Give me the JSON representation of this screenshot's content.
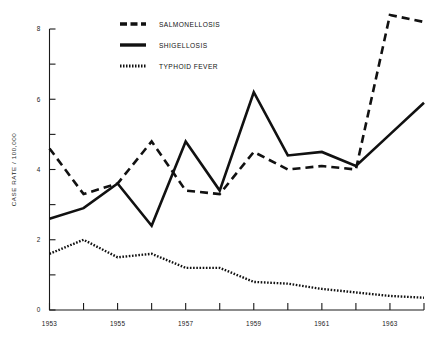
{
  "chart_data": {
    "type": "line",
    "title": "",
    "xlabel": "",
    "ylabel": "CASE RATE / 100,000",
    "x": [
      1953,
      1954,
      1955,
      1956,
      1957,
      1958,
      1959,
      1960,
      1961,
      1962,
      1963,
      1964
    ],
    "xlim": [
      1953,
      1964
    ],
    "ylim": [
      0,
      8
    ],
    "xticks": [
      1953,
      1954,
      1955,
      1956,
      1957,
      1958,
      1959,
      1960,
      1961,
      1962,
      1963,
      1964
    ],
    "xticklabels": [
      "1953",
      "",
      "1955",
      "",
      "1957",
      "",
      "1959",
      "",
      "1961",
      "",
      "1963",
      ""
    ],
    "yticks": [
      0,
      1,
      2,
      3,
      4,
      5,
      6,
      7,
      8
    ],
    "yticklabels": [
      "0",
      "",
      "2",
      "",
      "4",
      "",
      "6",
      "",
      "8"
    ],
    "grid": false,
    "legend_position": "top-center",
    "series": [
      {
        "name": "SALMONELLOSIS",
        "style": "dashed",
        "color": "#111111",
        "values": [
          4.6,
          3.3,
          3.6,
          4.8,
          3.4,
          3.3,
          4.5,
          4.0,
          4.1,
          4.0,
          8.4,
          8.2
        ]
      },
      {
        "name": "SHIGELLOSIS",
        "style": "solid",
        "color": "#111111",
        "values": [
          2.6,
          2.9,
          3.6,
          2.4,
          4.8,
          3.4,
          6.2,
          4.4,
          4.5,
          4.1,
          5.0,
          5.9
        ]
      },
      {
        "name": "TYPHOID FEVER",
        "style": "dotted",
        "color": "#111111",
        "values": [
          1.6,
          2.0,
          1.5,
          1.6,
          1.2,
          1.2,
          0.8,
          0.75,
          0.6,
          0.5,
          0.4,
          0.35
        ]
      }
    ]
  },
  "legend": {
    "items": [
      {
        "label": "SALMONELLOSIS",
        "style": "dashed"
      },
      {
        "label": "SHIGELLOSIS",
        "style": "solid"
      },
      {
        "label": "TYPHOID FEVER",
        "style": "dotted"
      }
    ]
  },
  "axes": {
    "y_axis_title": "CASE RATE / 100,000"
  }
}
